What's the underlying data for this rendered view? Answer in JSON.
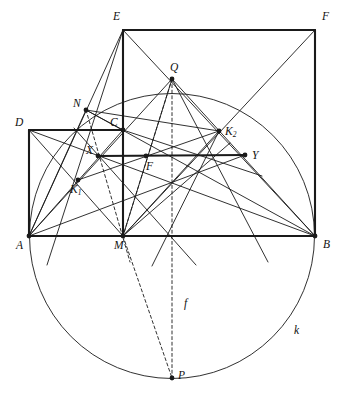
{
  "figure": {
    "stroke_color": "#1a1a1a",
    "background_color": "#ffffff",
    "thin_width": 0.9,
    "thick_width": 2.1,
    "dash_pattern": "3,2.6"
  },
  "circle": {
    "name": "k",
    "label": "k",
    "center": {
      "x": 172,
      "y": 236
    },
    "radius": 142.5,
    "label_pos": {
      "x": 294,
      "y": 325
    }
  },
  "points": {
    "A": {
      "label": "A",
      "x": 29,
      "y": 236,
      "dot": true,
      "label_pos": {
        "x": 16,
        "y": 240
      }
    },
    "B": {
      "label": "B",
      "x": 315,
      "y": 236,
      "dot": true,
      "label_pos": {
        "x": 323,
        "y": 239
      }
    },
    "M": {
      "label": "M",
      "x": 123,
      "y": 236,
      "dot": true,
      "label_pos": {
        "x": 114,
        "y": 240
      }
    },
    "C": {
      "label": "C",
      "x": 123,
      "y": 130,
      "dot": true,
      "label_pos": {
        "x": 110,
        "y": 117
      }
    },
    "D": {
      "label": "D",
      "x": 29,
      "y": 130,
      "dot": false,
      "label_pos": {
        "x": 15,
        "y": 117
      }
    },
    "E": {
      "label": "E",
      "x": 123,
      "y": 30,
      "dot": false,
      "label_pos": {
        "x": 113,
        "y": 11
      }
    },
    "F_corner": {
      "label": "F",
      "x": 315,
      "y": 30,
      "dot": false,
      "label_pos": {
        "x": 322,
        "y": 11
      }
    },
    "Q": {
      "label": "Q",
      "x": 172,
      "y": 79,
      "dot": true,
      "label_pos": {
        "x": 170,
        "y": 62
      }
    },
    "P": {
      "label": "P",
      "x": 172,
      "y": 378,
      "dot": true,
      "label_pos": {
        "x": 178,
        "y": 370
      }
    },
    "N": {
      "label": "N",
      "x": 86,
      "y": 110,
      "dot": true,
      "label_pos": {
        "x": 73,
        "y": 98
      }
    },
    "X": {
      "label": "X",
      "x": 98,
      "y": 156,
      "dot": true,
      "label_pos": {
        "x": 86,
        "y": 145
      }
    },
    "Y": {
      "label": "Y",
      "x": 245,
      "y": 155,
      "dot": true,
      "label_pos": {
        "x": 252,
        "y": 150
      }
    },
    "F_mid": {
      "label": "F",
      "x": 146,
      "y": 156,
      "dot": true,
      "label_pos": {
        "x": 146,
        "y": 161
      }
    },
    "K1": {
      "label": "K",
      "sub": "1",
      "x": 78,
      "y": 180,
      "dot": true,
      "label_pos": {
        "x": 70,
        "y": 184
      }
    },
    "K2": {
      "label": "K",
      "sub": "2",
      "x": 219,
      "y": 131,
      "dot": true,
      "label_pos": {
        "x": 225,
        "y": 126
      }
    }
  },
  "labels": {
    "line_f": {
      "text": "f",
      "x": 184,
      "y": 298
    }
  },
  "segments": {
    "thick": [
      {
        "name": "baseline-A-B",
        "x1": 29,
        "y1": 236,
        "x2": 315,
        "y2": 236
      },
      {
        "name": "side-A-D",
        "x1": 29,
        "y1": 236,
        "x2": 29,
        "y2": 130
      },
      {
        "name": "side-D-C",
        "x1": 29,
        "y1": 130,
        "x2": 123,
        "y2": 130
      },
      {
        "name": "side-M-E",
        "x1": 123,
        "y1": 236,
        "x2": 123,
        "y2": 30
      },
      {
        "name": "side-E-F",
        "x1": 123,
        "y1": 30,
        "x2": 315,
        "y2": 30
      },
      {
        "name": "side-F-B",
        "x1": 315,
        "y1": 30,
        "x2": 315,
        "y2": 236
      },
      {
        "name": "segment-X-Y",
        "x1": 98,
        "y1": 156,
        "x2": 245,
        "y2": 155
      }
    ],
    "thin": [
      {
        "name": "diagonal-A-C",
        "x1": 29,
        "y1": 236,
        "x2": 123,
        "y2": 130
      },
      {
        "name": "diagonal-D-M",
        "x1": 29,
        "y1": 130,
        "x2": 123,
        "y2": 236
      },
      {
        "name": "diagonal-M-F",
        "x1": 123,
        "y1": 236,
        "x2": 315,
        "y2": 30
      },
      {
        "name": "diagonal-E-B",
        "x1": 123,
        "y1": 30,
        "x2": 315,
        "y2": 236
      },
      {
        "name": "chord-A-E",
        "x1": 29,
        "y1": 236,
        "x2": 123,
        "y2": 30
      },
      {
        "name": "chord-A-Q",
        "x1": 29,
        "y1": 236,
        "x2": 172,
        "y2": 79
      },
      {
        "name": "chord-B-Q",
        "x1": 315,
        "y1": 236,
        "x2": 172,
        "y2": 79
      },
      {
        "name": "chord-M-Q",
        "x1": 123,
        "y1": 236,
        "x2": 172,
        "y2": 79
      },
      {
        "name": "chord-A-N",
        "x1": 29,
        "y1": 236,
        "x2": 86,
        "y2": 110
      },
      {
        "name": "chord-N-C",
        "x1": 86,
        "y1": 110,
        "x2": 123,
        "y2": 130
      },
      {
        "name": "chord-N-K2",
        "x1": 86,
        "y1": 110,
        "x2": 219,
        "y2": 131
      },
      {
        "name": "chord-N-B",
        "x1": 86,
        "y1": 110,
        "x2": 315,
        "y2": 236
      },
      {
        "name": "chord-M-K2",
        "x1": 123,
        "y1": 236,
        "x2": 219,
        "y2": 131
      },
      {
        "name": "chord-K1-K2",
        "x1": 78,
        "y1": 180,
        "x2": 219,
        "y2": 131
      },
      {
        "name": "chord-A-K1-Y",
        "x1": 29,
        "y1": 236,
        "x2": 245,
        "y2": 155
      },
      {
        "name": "chord-D-K1-B",
        "x1": 29,
        "y1": 130,
        "x2": 315,
        "y2": 236
      },
      {
        "name": "ray-E-K1-down",
        "x1": 123,
        "y1": 30,
        "x2": 47,
        "y2": 265
      },
      {
        "name": "ray-Q-Y-down",
        "x1": 172,
        "y1": 79,
        "x2": 268,
        "y2": 262
      },
      {
        "name": "ray-C-K2-right",
        "x1": 123,
        "y1": 130,
        "x2": 262,
        "y2": 176
      },
      {
        "name": "ray-M-right-up",
        "x1": 123,
        "y1": 236,
        "x2": 230,
        "y2": 143
      },
      {
        "name": "ray-K2-down-left",
        "x1": 219,
        "y1": 131,
        "x2": 152,
        "y2": 266
      },
      {
        "name": "ray-X-down-right",
        "x1": 74,
        "y1": 128,
        "x2": 196,
        "y2": 265
      }
    ],
    "dashed": [
      {
        "name": "dashed-N-to-M-area",
        "x1": 86,
        "y1": 110,
        "x2": 130,
        "y2": 262
      },
      {
        "name": "dashed-Q-to-P",
        "x1": 172,
        "y1": 79,
        "x2": 172,
        "y2": 378
      },
      {
        "name": "dashed-Q-to-M",
        "x1": 172,
        "y1": 79,
        "x2": 123,
        "y2": 236
      },
      {
        "name": "dashed-M-to-P",
        "x1": 123,
        "y1": 236,
        "x2": 172,
        "y2": 378
      }
    ]
  }
}
